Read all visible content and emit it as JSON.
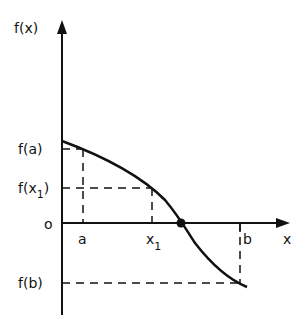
{
  "diagram": {
    "y_axis_label": "f(x)",
    "x_axis_label": "x",
    "y_ticks": [
      {
        "label": "f(a)",
        "y": 149
      },
      {
        "label": "f(x₁)",
        "y": 188
      },
      {
        "label": "o",
        "y": 223
      },
      {
        "label": "f(b)",
        "y": 283
      }
    ],
    "x_ticks": [
      {
        "label": "a",
        "x": 83
      },
      {
        "label": "x₁",
        "x": 152
      },
      {
        "label": "b",
        "x": 240
      }
    ],
    "labels": {
      "fx": "f(x)",
      "x": "x",
      "fa": "f(a)",
      "fx1_f": "f(x",
      "fx1_sub": "1",
      "fx1_close": ")",
      "origin": "o",
      "fb": "f(b)",
      "a": "a",
      "x1": "x",
      "x1_sub": "1",
      "b": "b"
    },
    "root_point": {
      "x": 181,
      "y": 223
    }
  }
}
